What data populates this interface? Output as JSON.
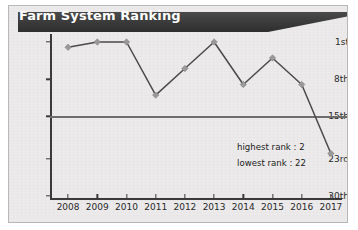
{
  "card": {
    "background_color": "#eceaea",
    "border_color": "#b9b7b7"
  },
  "banner": {
    "title": "Farm System Ranking",
    "background_color": "#3a3a3a",
    "text_color": "#ffffff"
  },
  "annotations": {
    "highest": "highest rank : 2",
    "lowest": "lowest rank : 22"
  },
  "chart_data": {
    "type": "line",
    "title": "Farm System Ranking",
    "xlabel": "",
    "ylabel": "",
    "x": [
      "2008",
      "2009",
      "2010",
      "2011",
      "2012",
      "2013",
      "2014",
      "2015",
      "2016",
      "2017"
    ],
    "categories": [
      "2008",
      "2009",
      "2010",
      "2011",
      "2012",
      "2013",
      "2014",
      "2015",
      "2016",
      "2017"
    ],
    "values": [
      2,
      1,
      1,
      11,
      6,
      1,
      9,
      4,
      9,
      22
    ],
    "series": [
      {
        "name": "Farm System Ranking",
        "values": [
          2,
          1,
          1,
          11,
          6,
          1,
          9,
          4,
          9,
          22
        ],
        "line_color": "#4b4b4b",
        "marker_color": "#9a9a9a",
        "marker": "diamond"
      }
    ],
    "y_axis": {
      "inverted": true,
      "ylim": [
        1,
        30
      ],
      "tick_values": [
        1,
        8,
        15,
        23,
        30
      ],
      "tick_labels": [
        "1st",
        "8th",
        "15th",
        "23rd",
        "30th"
      ]
    },
    "x_axis": {
      "tick_labels": [
        "2008",
        "2009",
        "2010",
        "2011",
        "2012",
        "2013",
        "2014",
        "2015",
        "2016",
        "2017"
      ]
    },
    "reference_line": {
      "value": 15,
      "label": "15th",
      "color": "#6d6d6d"
    },
    "grid": false,
    "legend": null,
    "annotations": [
      "highest rank : 2",
      "lowest rank : 22"
    ],
    "summary": {
      "highest_rank": 2,
      "lowest_rank": 22
    }
  }
}
